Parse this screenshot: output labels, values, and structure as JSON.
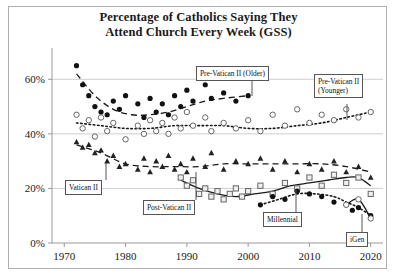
{
  "chart_data": {
    "type": "scatter",
    "title_line1": "Percentage of Catholics Saying They",
    "title_line2": "Attend Church Every Week (GSS)",
    "xlabel": "",
    "ylabel": "",
    "xlim": [
      1968,
      2022
    ],
    "ylim": [
      0,
      70
    ],
    "xticks": [
      1970,
      1980,
      1990,
      2000,
      2010,
      2020
    ],
    "xticklabels": [
      "1970",
      "1980",
      "1990",
      "2000",
      "2010",
      "2020"
    ],
    "yticks": [
      0,
      20,
      40,
      60
    ],
    "yticklabels": [
      "0%",
      "20%",
      "40%",
      "60%"
    ],
    "grid": "horizontal",
    "legend": "inline-boxed-annotations",
    "series": [
      {
        "name": "Pre-Vatican II (Older)",
        "marker": "filled-circle",
        "trend": "dashed",
        "points": [
          [
            1972,
            65
          ],
          [
            1973,
            58
          ],
          [
            1974,
            54
          ],
          [
            1975,
            50
          ],
          [
            1976,
            48
          ],
          [
            1977,
            47
          ],
          [
            1978,
            52
          ],
          [
            1979,
            49
          ],
          [
            1980,
            54
          ],
          [
            1982,
            51
          ],
          [
            1983,
            46
          ],
          [
            1984,
            53
          ],
          [
            1985,
            48
          ],
          [
            1986,
            51
          ],
          [
            1987,
            47
          ],
          [
            1988,
            54
          ],
          [
            1989,
            50
          ],
          [
            1990,
            56
          ],
          [
            1991,
            52
          ],
          [
            1993,
            58
          ],
          [
            1994,
            53
          ],
          [
            1996,
            55
          ],
          [
            1998,
            52
          ],
          [
            2000,
            54
          ]
        ],
        "trend_points": [
          [
            1972,
            62
          ],
          [
            1975,
            54
          ],
          [
            1978,
            49
          ],
          [
            1981,
            47
          ],
          [
            1984,
            47
          ],
          [
            1987,
            48
          ],
          [
            1990,
            50
          ],
          [
            1993,
            52
          ],
          [
            1996,
            53
          ],
          [
            2000,
            54
          ]
        ]
      },
      {
        "name": "Pre-Vatican II (Younger)",
        "marker": "open-circle",
        "trend": "dotted",
        "points": [
          [
            1972,
            47
          ],
          [
            1973,
            42
          ],
          [
            1974,
            45
          ],
          [
            1975,
            39
          ],
          [
            1976,
            46
          ],
          [
            1977,
            41
          ],
          [
            1978,
            44
          ],
          [
            1980,
            38
          ],
          [
            1982,
            43
          ],
          [
            1983,
            40
          ],
          [
            1984,
            45
          ],
          [
            1985,
            41
          ],
          [
            1986,
            44
          ],
          [
            1987,
            40
          ],
          [
            1988,
            46
          ],
          [
            1989,
            42
          ],
          [
            1990,
            48
          ],
          [
            1991,
            43
          ],
          [
            1993,
            46
          ],
          [
            1994,
            41
          ],
          [
            1996,
            44
          ],
          [
            1998,
            42
          ],
          [
            2000,
            45
          ],
          [
            2002,
            41
          ],
          [
            2004,
            47
          ],
          [
            2006,
            43
          ],
          [
            2008,
            49
          ],
          [
            2010,
            44
          ],
          [
            2012,
            47
          ],
          [
            2014,
            45
          ],
          [
            2016,
            49
          ],
          [
            2018,
            46
          ],
          [
            2020,
            48
          ]
        ],
        "trend_points": [
          [
            1972,
            44
          ],
          [
            1976,
            43
          ],
          [
            1980,
            42
          ],
          [
            1984,
            42
          ],
          [
            1988,
            43
          ],
          [
            1992,
            43
          ],
          [
            1996,
            43
          ],
          [
            2000,
            42
          ],
          [
            2004,
            42
          ],
          [
            2008,
            43
          ],
          [
            2012,
            44
          ],
          [
            2016,
            46
          ],
          [
            2020,
            48
          ]
        ]
      },
      {
        "name": "Vatican II",
        "marker": "filled-triangle",
        "trend": "dashed",
        "points": [
          [
            1972,
            37
          ],
          [
            1973,
            35
          ],
          [
            1974,
            36
          ],
          [
            1975,
            33
          ],
          [
            1976,
            34
          ],
          [
            1977,
            30
          ],
          [
            1978,
            32
          ],
          [
            1979,
            28
          ],
          [
            1980,
            29
          ],
          [
            1982,
            27
          ],
          [
            1983,
            31
          ],
          [
            1984,
            26
          ],
          [
            1985,
            30
          ],
          [
            1986,
            28
          ],
          [
            1987,
            32
          ],
          [
            1988,
            27
          ],
          [
            1989,
            29
          ],
          [
            1990,
            26
          ],
          [
            1991,
            31
          ],
          [
            1993,
            28
          ],
          [
            1994,
            33
          ],
          [
            1996,
            27
          ],
          [
            1998,
            30
          ],
          [
            2000,
            29
          ],
          [
            2002,
            31
          ],
          [
            2004,
            27
          ],
          [
            2006,
            30
          ],
          [
            2008,
            26
          ],
          [
            2010,
            29
          ],
          [
            2012,
            27
          ],
          [
            2014,
            30
          ],
          [
            2016,
            26
          ],
          [
            2018,
            28
          ],
          [
            2020,
            24
          ]
        ],
        "trend_points": [
          [
            1972,
            36
          ],
          [
            1976,
            33
          ],
          [
            1980,
            29
          ],
          [
            1984,
            28
          ],
          [
            1988,
            28
          ],
          [
            1992,
            28
          ],
          [
            1996,
            29
          ],
          [
            2000,
            29
          ],
          [
            2004,
            29
          ],
          [
            2008,
            29
          ],
          [
            2012,
            29
          ],
          [
            2016,
            28
          ],
          [
            2020,
            26
          ]
        ]
      },
      {
        "name": "Post-Vatican II",
        "marker": "open-square",
        "trend": "solid",
        "points": [
          [
            1989,
            24
          ],
          [
            1990,
            21
          ],
          [
            1991,
            23
          ],
          [
            1992,
            18
          ],
          [
            1993,
            20
          ],
          [
            1994,
            17
          ],
          [
            1995,
            19
          ],
          [
            1996,
            16
          ],
          [
            1997,
            18
          ],
          [
            1998,
            20
          ],
          [
            1999,
            17
          ],
          [
            2000,
            19
          ],
          [
            2002,
            21
          ],
          [
            2004,
            18
          ],
          [
            2006,
            22
          ],
          [
            2008,
            20
          ],
          [
            2010,
            24
          ],
          [
            2012,
            21
          ],
          [
            2014,
            25
          ],
          [
            2016,
            22
          ],
          [
            2018,
            24
          ],
          [
            2020,
            18
          ]
        ],
        "trend_points": [
          [
            1989,
            23
          ],
          [
            1992,
            20
          ],
          [
            1995,
            18
          ],
          [
            1998,
            17
          ],
          [
            2001,
            18
          ],
          [
            2004,
            19
          ],
          [
            2007,
            21
          ],
          [
            2010,
            22
          ],
          [
            2013,
            23
          ],
          [
            2016,
            24
          ],
          [
            2018,
            24
          ],
          [
            2020,
            21
          ]
        ]
      },
      {
        "name": "Millennial",
        "marker": "filled-circle",
        "trend": "dotted",
        "points": [
          [
            2002,
            14
          ],
          [
            2004,
            17
          ],
          [
            2006,
            16
          ],
          [
            2008,
            19
          ],
          [
            2010,
            18
          ],
          [
            2012,
            17
          ],
          [
            2014,
            15
          ],
          [
            2016,
            14
          ],
          [
            2017,
            12
          ],
          [
            2018,
            13
          ],
          [
            2020,
            10
          ]
        ],
        "trend_points": [
          [
            2002,
            14
          ],
          [
            2005,
            16
          ],
          [
            2008,
            18
          ],
          [
            2011,
            18
          ],
          [
            2014,
            17
          ],
          [
            2016,
            15
          ],
          [
            2018,
            13
          ],
          [
            2020,
            10
          ]
        ]
      },
      {
        "name": "iGen",
        "marker": "open-circle",
        "trend": "solid",
        "points": [
          [
            2016,
            14
          ],
          [
            2018,
            16
          ],
          [
            2020,
            9
          ]
        ],
        "trend_points": [
          [
            2016,
            14
          ],
          [
            2018,
            16
          ],
          [
            2020,
            9
          ]
        ]
      }
    ],
    "annotations": [
      {
        "id": "pre-vatican-older",
        "text": "Pre-Vatican II (Older)"
      },
      {
        "id": "pre-vatican-younger-l1",
        "text": "Pre-Vatican II"
      },
      {
        "id": "pre-vatican-younger-l2",
        "text": "(Younger)"
      },
      {
        "id": "vatican-ii",
        "text": "Vatican II"
      },
      {
        "id": "post-vatican-ii",
        "text": "Post-Vatican II"
      },
      {
        "id": "millennial",
        "text": "Millennial"
      },
      {
        "id": "igen",
        "text": "iGen"
      }
    ]
  }
}
